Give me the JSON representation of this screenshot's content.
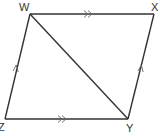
{
  "diagram": {
    "type": "parallelogram",
    "vertices": [
      {
        "name": "W",
        "x": 30,
        "y": 14
      },
      {
        "name": "X",
        "x": 154,
        "y": 14
      },
      {
        "name": "Y",
        "x": 128,
        "y": 119
      },
      {
        "name": "Z",
        "x": 5,
        "y": 119
      }
    ],
    "edges": [
      {
        "from": "W",
        "to": "X",
        "marker": "double-arrow"
      },
      {
        "from": "Z",
        "to": "Y",
        "marker": "double-arrow"
      },
      {
        "from": "Z",
        "to": "W",
        "marker": "single-arrow"
      },
      {
        "from": "Y",
        "to": "X",
        "marker": "single-arrow"
      },
      {
        "from": "W",
        "to": "Y",
        "marker": "none",
        "role": "diagonal"
      }
    ],
    "labels": {
      "W": "W",
      "X": "X",
      "Y": "Y",
      "Z": "Z"
    },
    "line_color": "#333333"
  }
}
